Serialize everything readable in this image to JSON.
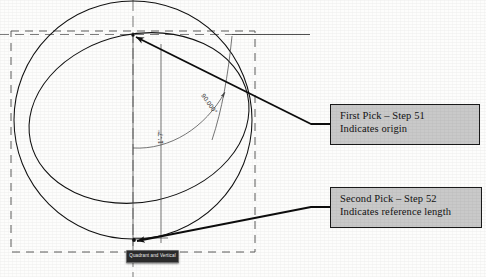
{
  "figure": {
    "background_color": "#fdfdfc",
    "line_color": "#1a1a1a"
  },
  "callouts": [
    {
      "id": "first-pick",
      "line1": "First Pick – Step 51",
      "line2": "Indicates origin",
      "fill_color": "#c9c9c9",
      "border_color": "#1a1a1a"
    },
    {
      "id": "second-pick",
      "line1": "Second Pick – Step 52",
      "line2": "Indicates reference length",
      "fill_color": "#c9c9c9",
      "border_color": "#1a1a1a"
    }
  ],
  "dimensions": {
    "angle": "90.000°",
    "length": "1'-7\""
  },
  "snap_tooltip": {
    "label": "Quadrant and Vertical",
    "background_color": "#2b2b2b",
    "text_color": "#f2f2f2"
  },
  "geometry": {
    "circle": {
      "cx": 133,
      "cy": 120,
      "r": 119
    },
    "ellipse": {
      "cx": 139,
      "cy": 118,
      "rx": 111,
      "ry": 84,
      "rotation": -12
    },
    "selection_box": {
      "x": 11,
      "y": 31,
      "width": 244,
      "height": 221,
      "style": "dashed"
    },
    "pick_points": [
      {
        "name": "origin",
        "x": 133,
        "y": 35
      },
      {
        "name": "reference-length",
        "x": 134,
        "y": 240
      }
    ]
  }
}
